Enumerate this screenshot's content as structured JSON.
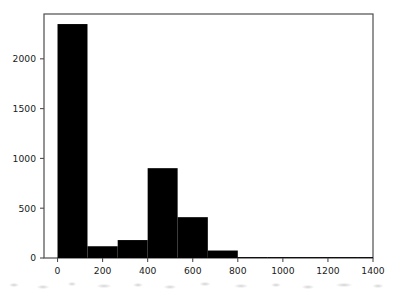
{
  "chart_data": {
    "type": "bar",
    "title": "",
    "subtitle": "",
    "xlabel": "",
    "ylabel": "",
    "xlim": [
      -60,
      1400
    ],
    "ylim": [
      0,
      2450
    ],
    "grid": false,
    "legend": null,
    "bar_color": "#000000",
    "axes_color": "#4d4d4d",
    "background_color": "#ffffff",
    "bin_width": 133,
    "bin_edges": [
      0,
      133,
      267,
      400,
      533,
      667,
      800,
      933,
      1067,
      1200,
      1333,
      1400
    ],
    "categories": [
      "0-133",
      "133-267",
      "267-400",
      "400-533",
      "533-667",
      "667-800",
      "800-933",
      "933-1067",
      "1067-1200",
      "1200-1333",
      "1333-1400"
    ],
    "values": [
      2349,
      118,
      180,
      902,
      410,
      75,
      4,
      2,
      2,
      1,
      3
    ],
    "x_ticks": [
      0,
      200,
      400,
      600,
      800,
      1000,
      1200,
      1400
    ],
    "x_tick_labels": [
      "0",
      "200",
      "400",
      "600",
      "800",
      "1000",
      "1200",
      "1400"
    ],
    "y_ticks": [
      0,
      500,
      1000,
      1500,
      2000
    ],
    "y_tick_labels": [
      "0",
      "500",
      "1000",
      "1500",
      "2000"
    ]
  }
}
